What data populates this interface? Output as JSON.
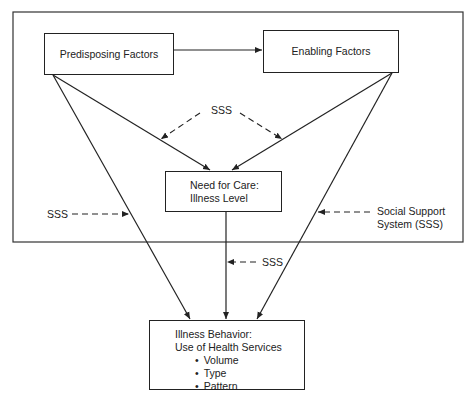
{
  "diagram": {
    "nodes": {
      "predisposing": {
        "label": "Predisposing Factors"
      },
      "enabling": {
        "label": "Enabling Factors"
      },
      "need": {
        "line1": "Need for Care:",
        "line2": "Illness Level"
      },
      "behavior": {
        "line1": "Illness Behavior:",
        "line2": "Use of Health Services",
        "bullets": [
          "Volume",
          "Type",
          "Pattern"
        ]
      }
    },
    "labels": {
      "sss_top": "SSS",
      "sss_left": "SSS",
      "sss_bottom": "SSS",
      "sss_legend_line1": "Social Support",
      "sss_legend_line2": "System (SSS)"
    },
    "edges": [
      {
        "from": "Predisposing Factors",
        "to": "Enabling Factors",
        "style": "solid"
      },
      {
        "from": "Predisposing Factors",
        "to": "Need for Care: Illness Level",
        "style": "solid"
      },
      {
        "from": "Enabling Factors",
        "to": "Need for Care: Illness Level",
        "style": "solid"
      },
      {
        "from": "Predisposing Factors",
        "to": "Illness Behavior",
        "style": "solid"
      },
      {
        "from": "Enabling Factors",
        "to": "Illness Behavior",
        "style": "solid"
      },
      {
        "from": "Need for Care: Illness Level",
        "to": "Illness Behavior",
        "style": "solid"
      },
      {
        "from": "SSS",
        "to": "Predisposing→Need edge",
        "style": "dashed"
      },
      {
        "from": "SSS",
        "to": "Enabling→Need edge",
        "style": "dashed"
      },
      {
        "from": "SSS",
        "to": "Predisposing→Behavior edge",
        "style": "dashed"
      },
      {
        "from": "Social Support System (SSS)",
        "to": "Enabling→Behavior edge",
        "style": "dashed"
      },
      {
        "from": "SSS",
        "to": "Need→Behavior edge",
        "style": "dashed"
      }
    ],
    "colors": {
      "line": "#222222",
      "background": "#ffffff"
    }
  }
}
